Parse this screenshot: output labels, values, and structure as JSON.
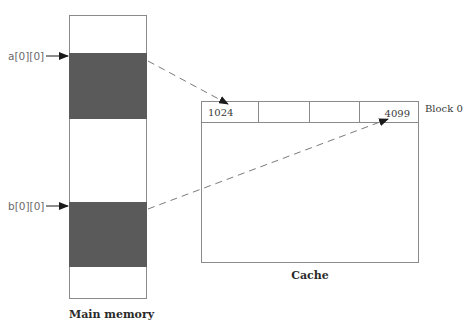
{
  "diagram": {
    "type": "memory-to-cache mapping",
    "main_memory": {
      "caption": "Main memory",
      "regions": [
        {
          "pointer_label": "a[0][0]",
          "shaded": true
        },
        {
          "pointer_label": "b[0][0]",
          "shaded": true
        }
      ]
    },
    "cache": {
      "caption": "Cache",
      "block_label": "Block 0",
      "block0_cells": [
        "1024",
        "",
        "",
        "4099"
      ]
    },
    "mappings": [
      {
        "from": "a[0][0]",
        "to": "1024",
        "style": "dashed-arrow"
      },
      {
        "from": "b[0][0]",
        "to": "4099",
        "style": "dashed-arrow"
      }
    ],
    "colors": {
      "shade": "#5a5a5a",
      "border": "#8a8a8a",
      "dash": "#7a7a7a",
      "arrow": "#1a1a1a"
    }
  }
}
